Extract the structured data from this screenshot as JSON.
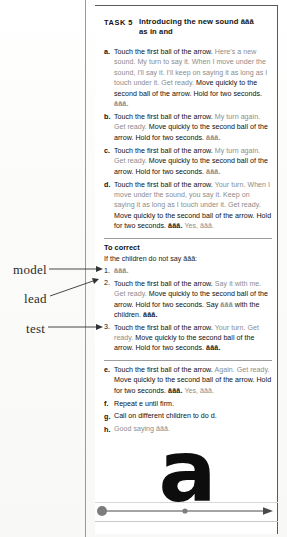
{
  "page": {
    "task_label": "TASK 5",
    "title_line1": "Introducing the new sound ăăă",
    "title_line2": "as in and",
    "sound": "ăăă",
    "letter": "a"
  },
  "margin_annotations": [
    {
      "label": "model",
      "target": "correction step 1"
    },
    {
      "label": "lead",
      "target": "correction step 2"
    },
    {
      "label": "test",
      "target": "correction step 3"
    }
  ],
  "steps": [
    {
      "letter": "a.",
      "teacher": "Touch the first ball of the arrow.",
      "script": "Here's a new sound. My turn to say it. When I move under the sound, I'll say it. I'll keep on saying it as long as I touch under it. Get ready.",
      "teacher2": "Move quickly to the second ball of the arrow. Hold for two seconds.",
      "sound": "ăăă."
    },
    {
      "letter": "b.",
      "teacher": "Touch the first ball of the arrow.",
      "script": "My turn again. Get ready.",
      "teacher2": "Move quickly to the second ball of the arrow. Hold for two seconds.",
      "sound": "ăăă."
    },
    {
      "letter": "c.",
      "teacher": "Touch the first ball of the arrow.",
      "script": "My turn again. Get ready.",
      "teacher2": "Move quickly to the second ball of the arrow. Hold for two seconds.",
      "sound": "ăăă."
    },
    {
      "letter": "d.",
      "teacher": "Touch the first ball of the arrow.",
      "script": "Your turn. When I move under the sound, you say it. Keep on saying it as long as I touch under it. Get ready.",
      "teacher2": "Move quickly to the second ball of the arrow. Hold for two seconds.",
      "sound": "ăăă.",
      "praise": "Yes, ăăă."
    }
  ],
  "correction": {
    "heading": "To correct",
    "lede": "If the children do not say ăăă:",
    "items": [
      {
        "num": "1.",
        "teacher": "",
        "script": "",
        "sound": "ăăă."
      },
      {
        "num": "2.",
        "teacher": "Touch the first ball of the arrow.",
        "script": "Say it with me. Get ready.",
        "teacher2": "Move quickly to the second ball of the arrow. Hold for two seconds. Say",
        "sound_mid": "ăăă",
        "teacher3": "with the children.",
        "sound": "ăăă."
      },
      {
        "num": "3.",
        "teacher": "Touch the first ball of the arrow.",
        "script": "Your turn. Get ready.",
        "teacher2": "Move quickly to the second ball of the arrow. Hold for two seconds.",
        "sound": "ăăă."
      }
    ]
  },
  "steps_after": [
    {
      "letter": "e.",
      "teacher": "Touch the first ball of the arrow.",
      "script": "Again. Get ready.",
      "teacher2": "Move quickly to the second ball of the arrow. Hold for two seconds.",
      "sound": "ăăă.",
      "praise": "Yes, ăăă."
    },
    {
      "letter": "f.",
      "plain": "Repeat e until firm.",
      "italic_ref": "e"
    },
    {
      "letter": "g.",
      "plain": "Call on different children to do d.",
      "italic_ref": "d"
    },
    {
      "letter": "h.",
      "praise_only": "Good saying ăăă."
    }
  ],
  "arrow": {
    "first_ball_label": "first ball",
    "second_ball_label": "second ball",
    "direction": "left-to-right"
  },
  "colors": {
    "teacher_text": "#101010",
    "script_text": "#8c8c8c",
    "rule": "#9d9d9d",
    "border": "#5a5a5a"
  }
}
